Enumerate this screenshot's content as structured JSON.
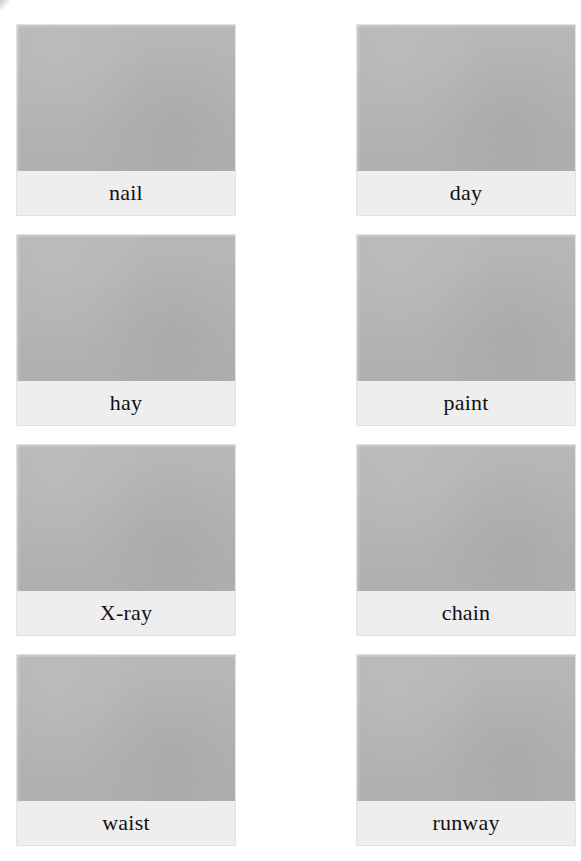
{
  "page": {
    "layout": {
      "columns": 2,
      "rows": 4,
      "total_cards": 8
    },
    "colors": {
      "page_background": "#ffffff",
      "image_placeholder": "#b5b5b5",
      "label_band": "#eeeeee",
      "card_border": "#e2e2e2",
      "label_text": "#111111"
    }
  },
  "cards": [
    {
      "label": "nail",
      "image_alt": "nail-image",
      "position": "row-1-left"
    },
    {
      "label": "day",
      "image_alt": "day-image",
      "position": "row-1-right"
    },
    {
      "label": "hay",
      "image_alt": "hay-image",
      "position": "row-2-left"
    },
    {
      "label": "paint",
      "image_alt": "paint-image",
      "position": "row-2-right"
    },
    {
      "label": "X-ray",
      "image_alt": "x-ray-image",
      "position": "row-3-left"
    },
    {
      "label": "chain",
      "image_alt": "chain-image",
      "position": "row-3-right"
    },
    {
      "label": "waist",
      "image_alt": "waist-image",
      "position": "row-4-left"
    },
    {
      "label": "runway",
      "image_alt": "runway-image",
      "position": "row-4-right"
    }
  ]
}
